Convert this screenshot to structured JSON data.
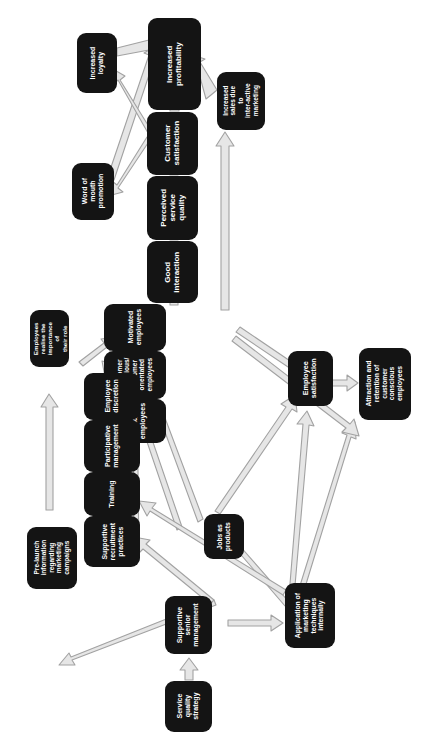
{
  "diagram": {
    "orientation": "rotated-90-ccw",
    "box_color": "#141414",
    "text_color": "#ffffff",
    "arrow_fill": "#e3e3e3",
    "arrow_stroke": "#9a9a9a",
    "background": "#ffffff"
  },
  "nodes": [
    {
      "id": "increased_profitability",
      "label": "Increased\nprofitability"
    },
    {
      "id": "increased_loyalty",
      "label": "Increased\nloyalty"
    },
    {
      "id": "increased_sales_interactive",
      "label": "Increased\nsales due\nto\ninter-active\nmarketing"
    },
    {
      "id": "customer_satisfaction",
      "label": "Customer\nsatisfaction"
    },
    {
      "id": "word_of_mouth",
      "label": "Word of\nmouth\npromotion"
    },
    {
      "id": "perceived_service_quality",
      "label": "Perceived\nservice quality"
    },
    {
      "id": "good_interaction",
      "label": "Good\ninteraction"
    },
    {
      "id": "motivated_employees",
      "label": "Motivated\nemployees"
    },
    {
      "id": "customer_conscious_employees",
      "label": "Customer\nconscious/\ncustomer\norientated\nemployees"
    },
    {
      "id": "sales_minded_employees",
      "label": "Sales minded\nemployees"
    },
    {
      "id": "employees_realise_importance",
      "label": "Employees\nrealise the\nimportance of\ntheir role"
    },
    {
      "id": "employee_discretion",
      "label": "Employee\ndiscretion"
    },
    {
      "id": "participative_management",
      "label": "Participative\nmanagement"
    },
    {
      "id": "training",
      "label": "Training"
    },
    {
      "id": "supportive_recruitment",
      "label": "Supportive\nrecruitment\npractices"
    },
    {
      "id": "employee_satisfaction",
      "label": "Employee\nsatisfaction"
    },
    {
      "id": "attraction_retention",
      "label": "Attraction and\nretention of customer\nconscious employees"
    },
    {
      "id": "jobs_as_products",
      "label": "Jobs as\nproducts"
    },
    {
      "id": "prelaunch_information",
      "label": "Pre-launch\ninformation\nregarding\nmarketing\ncampaigns"
    },
    {
      "id": "supportive_senior_management",
      "label": "Supportive\nsenior\nmanagement"
    },
    {
      "id": "application_marketing_internally",
      "label": "Application of\nmarketing\ntechniques\ninternally"
    },
    {
      "id": "service_quality_strategy",
      "label": "Service quality\nstrategy"
    }
  ],
  "edges": [
    {
      "from": "increased_loyalty",
      "to": "increased_profitability"
    },
    {
      "from": "word_of_mouth",
      "to": "increased_profitability"
    },
    {
      "from": "customer_satisfaction",
      "to": "increased_profitability"
    },
    {
      "from": "increased_sales_interactive",
      "to": "increased_profitability"
    },
    {
      "from": "customer_satisfaction",
      "to": "increased_loyalty"
    },
    {
      "from": "customer_satisfaction",
      "to": "word_of_mouth"
    },
    {
      "from": "perceived_service_quality",
      "to": "customer_satisfaction"
    },
    {
      "from": "good_interaction",
      "to": "perceived_service_quality"
    },
    {
      "from": "customer_conscious_employees",
      "to": "good_interaction"
    },
    {
      "from": "sales_minded_employees",
      "to": "increased_sales_interactive"
    },
    {
      "from": "employees_realise_importance",
      "to": "motivated_employees"
    },
    {
      "from": "employee_discretion",
      "to": "motivated_employees"
    },
    {
      "from": "training",
      "to": "customer_conscious_employees"
    },
    {
      "from": "supportive_recruitment",
      "to": "customer_conscious_employees"
    },
    {
      "from": "jobs_as_products",
      "to": "customer_conscious_employees"
    },
    {
      "from": "jobs_as_products",
      "to": "employee_satisfaction"
    },
    {
      "from": "application_marketing_internally",
      "to": "jobs_as_products"
    },
    {
      "from": "application_marketing_internally",
      "to": "attraction_retention"
    },
    {
      "from": "application_marketing_internally",
      "to": "employee_satisfaction"
    },
    {
      "from": "employee_satisfaction",
      "to": "attraction_retention"
    },
    {
      "from": "sales_minded_employees",
      "to": "employee_satisfaction"
    },
    {
      "from": "supportive_senior_management",
      "to": "prelaunch_information"
    },
    {
      "from": "supportive_senior_management",
      "to": "supportive_recruitment"
    },
    {
      "from": "supportive_senior_management",
      "to": "application_marketing_internally"
    },
    {
      "from": "prelaunch_information",
      "to": "employees_realise_importance"
    },
    {
      "from": "service_quality_strategy",
      "to": "supportive_senior_management"
    },
    {
      "from": "application_marketing_internally",
      "to": "training"
    }
  ]
}
